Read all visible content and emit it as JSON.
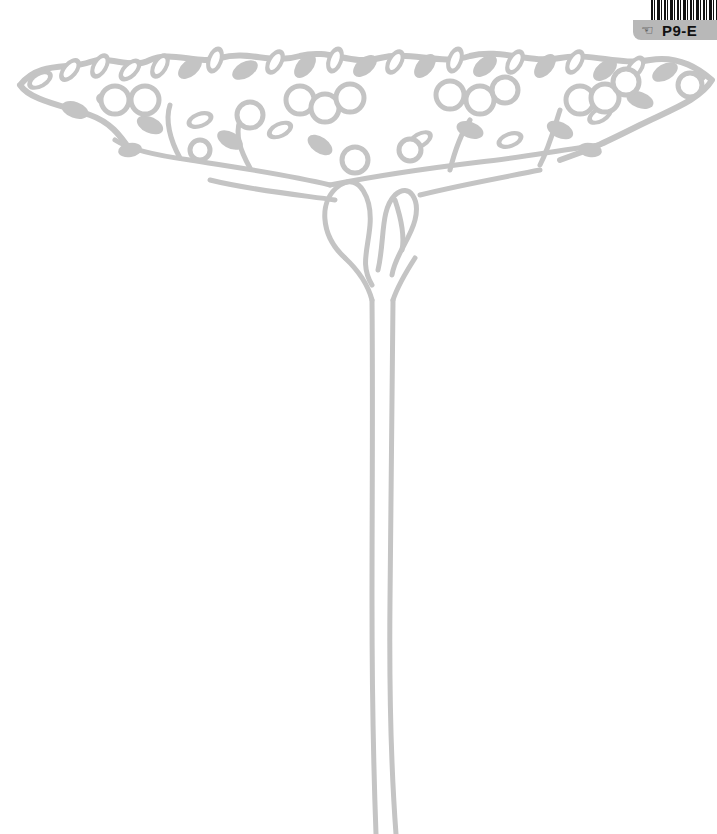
{
  "illustration": {
    "subject": "stylized fruit tree with wide canopy and tall slender trunk",
    "line_color": "#c4c4c4",
    "background": "#ffffff"
  },
  "library_label": {
    "icon": "hand-pointer-icon",
    "icon_glyph": "☜",
    "code": "P9-E",
    "tag_color": "#b8b8b8"
  }
}
